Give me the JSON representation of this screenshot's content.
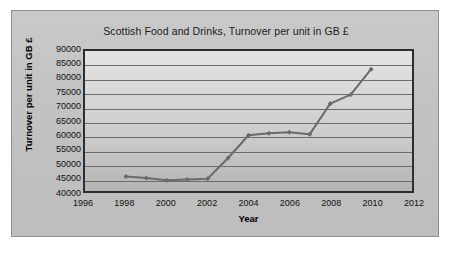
{
  "chart_data": {
    "type": "line",
    "title": "Scottish Food and Drinks, Turnover per unit in GB £",
    "xlabel": "Year",
    "ylabel": "Turnover per unit in GB £",
    "xlim": [
      1996,
      2012
    ],
    "ylim": [
      40000,
      90000
    ],
    "grid": true,
    "legend": "none",
    "x_ticks": [
      1996,
      1998,
      2000,
      2002,
      2004,
      2006,
      2008,
      2010,
      2012
    ],
    "y_ticks": [
      40000,
      45000,
      50000,
      55000,
      60000,
      65000,
      70000,
      75000,
      80000,
      85000,
      90000
    ],
    "x_tick_labels": [
      "1996",
      "1998",
      "2000",
      "2002",
      "2004",
      "2006",
      "2008",
      "2010",
      "2012"
    ],
    "y_tick_labels": [
      "40000",
      "45000",
      "50000",
      "55000",
      "60000",
      "65000",
      "70000",
      "75000",
      "80000",
      "85000",
      "90000"
    ],
    "series": [
      {
        "name": "Turnover per unit",
        "color": "#6b6b6b",
        "marker": "diamond",
        "x": [
          1998,
          1999,
          2000,
          2001,
          2002,
          2003,
          2004,
          2005,
          2006,
          2007,
          2008,
          2009,
          2010
        ],
        "values": [
          45200,
          44600,
          43800,
          44100,
          44400,
          51800,
          59900,
          60600,
          61000,
          60300,
          71200,
          74400,
          83500
        ]
      }
    ]
  }
}
